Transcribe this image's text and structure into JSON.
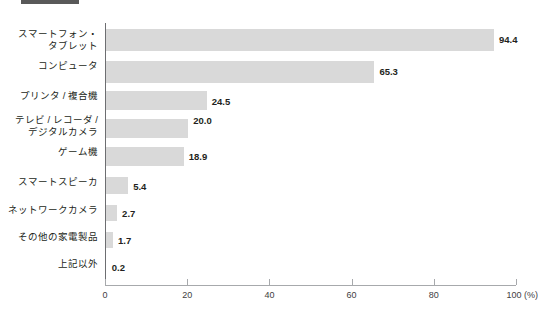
{
  "top_tag": {
    "name": "cropped-section-tag",
    "color": "#595959"
  },
  "chart_data": {
    "type": "bar",
    "orientation": "horizontal",
    "title": "",
    "xlabel": "",
    "ylabel": "",
    "xlim": [
      0,
      100
    ],
    "grid": false,
    "legend": null,
    "unit_label": "(%)",
    "axis_ticks": [
      "0",
      "20",
      "40",
      "60",
      "80",
      "100"
    ],
    "tick_values": [
      0,
      20,
      40,
      60,
      80,
      100
    ],
    "categories": [
      "スマートフォン・\nタブレット",
      "コンピュータ",
      "プリンタ / 複合機",
      "テレビ / レコーダ /\nデジタルカメラ",
      "ゲーム機",
      "スマートスピーカ",
      "ネットワークカメラ",
      "その他の家電製品",
      "上記以外"
    ],
    "values": [
      94.4,
      65.3,
      24.5,
      20.0,
      18.9,
      5.4,
      2.7,
      1.7,
      0.2
    ],
    "value_labels": [
      "94.4",
      "65.3",
      "24.5",
      "20.0",
      "18.9",
      "5.4",
      "2.7",
      "1.7",
      "0.2"
    ],
    "bar_color": "#d9d9d9",
    "axis_color": "#a7a9ac"
  }
}
